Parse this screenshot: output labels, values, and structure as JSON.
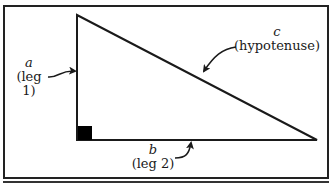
{
  "diagram": {
    "colors": {
      "line": "#1a1a1a",
      "background": "#ffffff",
      "frame": "#222222"
    },
    "sides": [
      {
        "id": "a",
        "variable": "a",
        "description": "(leg 1)"
      },
      {
        "id": "b",
        "variable": "b",
        "description": "(leg 2)"
      },
      {
        "id": "c",
        "variable": "c",
        "description": "(hypotenuse)"
      }
    ],
    "right_angle_marker": "filled-square"
  }
}
